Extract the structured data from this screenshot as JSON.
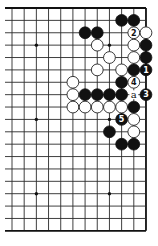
{
  "diagram": {
    "type": "go-board-fragment",
    "visible_columns": 12,
    "visible_rows": 19,
    "edges": [
      "top",
      "right",
      "bottom"
    ],
    "colors": {
      "black": "#111111",
      "white": "#ffffff",
      "line": "#2a2a2a",
      "background": "#ffffff"
    },
    "star_points": [
      {
        "col": 2,
        "row": 3
      },
      {
        "col": 8,
        "row": 3
      },
      {
        "col": 2,
        "row": 9
      },
      {
        "col": 8,
        "row": 9
      },
      {
        "col": 2,
        "row": 15
      },
      {
        "col": 8,
        "row": 15
      }
    ],
    "stones": [
      {
        "color": "black",
        "col": 9,
        "row": 1
      },
      {
        "color": "black",
        "col": 10,
        "row": 1
      },
      {
        "color": "black",
        "col": 6,
        "row": 2
      },
      {
        "color": "black",
        "col": 7,
        "row": 2
      },
      {
        "color": "white",
        "col": 10,
        "row": 2,
        "label": "2"
      },
      {
        "color": "white",
        "col": 11,
        "row": 2
      },
      {
        "color": "white",
        "col": 7,
        "row": 3
      },
      {
        "color": "white",
        "col": 10,
        "row": 3
      },
      {
        "color": "black",
        "col": 11,
        "row": 3
      },
      {
        "color": "white",
        "col": 8,
        "row": 4
      },
      {
        "color": "white",
        "col": 10,
        "row": 4
      },
      {
        "color": "black",
        "col": 11,
        "row": 4
      },
      {
        "color": "white",
        "col": 7,
        "row": 5
      },
      {
        "color": "white",
        "col": 9,
        "row": 5
      },
      {
        "color": "black",
        "col": 10,
        "row": 5
      },
      {
        "color": "black",
        "col": 11,
        "row": 5,
        "label": "1"
      },
      {
        "color": "white",
        "col": 5,
        "row": 6
      },
      {
        "color": "black",
        "col": 9,
        "row": 6
      },
      {
        "color": "white",
        "col": 10,
        "row": 6,
        "label": "4"
      },
      {
        "color": "white",
        "col": 5,
        "row": 7
      },
      {
        "color": "black",
        "col": 6,
        "row": 7
      },
      {
        "color": "black",
        "col": 7,
        "row": 7
      },
      {
        "color": "black",
        "col": 8,
        "row": 7
      },
      {
        "color": "black",
        "col": 9,
        "row": 7
      },
      {
        "color": "black",
        "col": 11,
        "row": 7,
        "label": "3"
      },
      {
        "color": "white",
        "col": 5,
        "row": 8
      },
      {
        "color": "white",
        "col": 6,
        "row": 8
      },
      {
        "color": "white",
        "col": 7,
        "row": 8
      },
      {
        "color": "white",
        "col": 8,
        "row": 8
      },
      {
        "color": "white",
        "col": 9,
        "row": 8
      },
      {
        "color": "black",
        "col": 10,
        "row": 8
      },
      {
        "color": "black",
        "col": 9,
        "row": 9,
        "label": "5"
      },
      {
        "color": "white",
        "col": 10,
        "row": 9
      },
      {
        "color": "black",
        "col": 8,
        "row": 10
      },
      {
        "color": "white",
        "col": 10,
        "row": 10
      },
      {
        "color": "black",
        "col": 9,
        "row": 11
      },
      {
        "color": "black",
        "col": 10,
        "row": 11
      }
    ],
    "markers": [
      {
        "col": 10,
        "row": 7,
        "label": "a"
      }
    ]
  }
}
